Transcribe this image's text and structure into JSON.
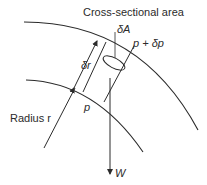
{
  "diagram": {
    "type": "fluid-element-on-curved-streamline",
    "labels": {
      "cross_section": "Cross-sectional area",
      "delta_a": "δA",
      "pressure_top": "p + δp",
      "delta_r": "δr",
      "pressure_bottom": "p",
      "radius": "Radius r",
      "weight": "W"
    },
    "colors": {
      "line": "#2b2b2b",
      "background": "#ffffff"
    }
  }
}
